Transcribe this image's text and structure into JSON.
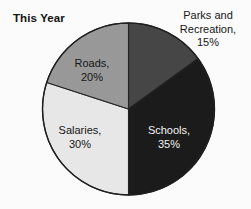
{
  "chart_data": {
    "type": "pie",
    "title": "This Year",
    "xlabel": "",
    "ylabel": "",
    "legend_position": "none",
    "grid": false,
    "start_angle_deg": 0,
    "direction": "clockwise",
    "categories": [
      "Parks and Recreation",
      "Schools",
      "Salaries",
      "Roads"
    ],
    "values": [
      15,
      35,
      30,
      20
    ],
    "value_unit": "%",
    "slices": [
      {
        "name": "Parks and Recreation",
        "value": 15,
        "label": "Parks and Recreation, 15%",
        "label_line1": "Parks and",
        "label_line2": "Recreation,",
        "label_line3": "15%",
        "color": "#464646",
        "label_placement": "outside",
        "label_text_color": "#161616"
      },
      {
        "name": "Schools",
        "value": 35,
        "label": "Schools, 35%",
        "label_line1": "Schools,",
        "label_line2": "35%",
        "color": "#1b1b1b",
        "label_placement": "inside",
        "label_text_color": "#f6f6f6"
      },
      {
        "name": "Salaries",
        "value": 30,
        "label": "Salaries, 30%",
        "label_line1": "Salaries,",
        "label_line2": "30%",
        "color": "#e9e9e9",
        "label_placement": "inside",
        "label_text_color": "#161616"
      },
      {
        "name": "Roads",
        "value": 20,
        "label": "Roads, 20%",
        "label_line1": "Roads,",
        "label_line2": "20%",
        "color": "#9a9a9a",
        "label_placement": "inside",
        "label_text_color": "#161616"
      }
    ],
    "outline_color": "#232323",
    "background_color": "#fdfdfd"
  }
}
